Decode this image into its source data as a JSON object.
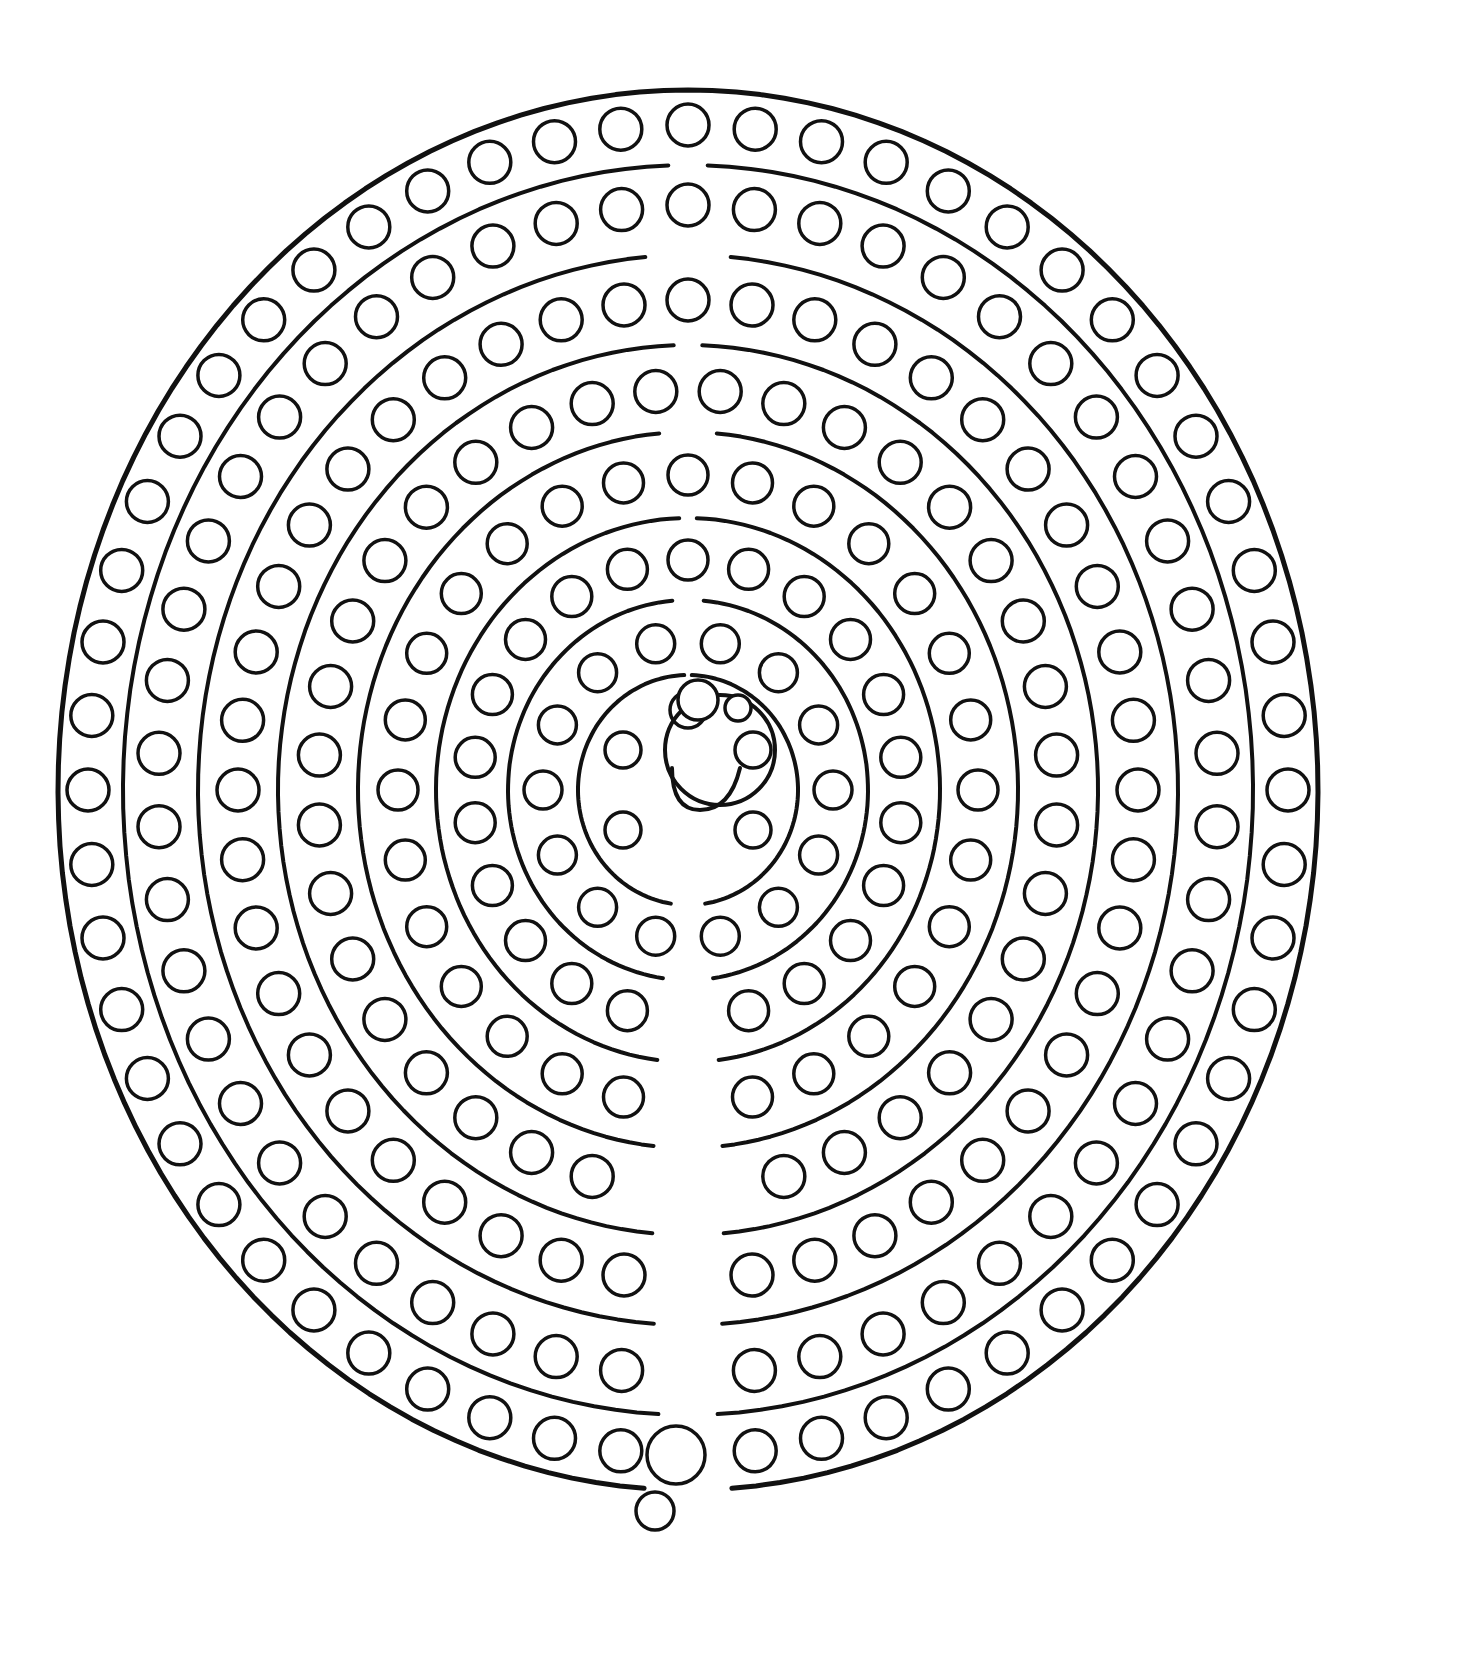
{
  "image": {
    "subject": "dot marker labyrinth coloring page",
    "background_color": "#ffffff",
    "line_color": "#111111",
    "width": 1479,
    "height": 1659
  },
  "labyrinth": {
    "center": [
      688,
      790
    ],
    "outer_boundary": {
      "rx": 630,
      "ry": 700,
      "stroke": 5
    },
    "rings": [
      {
        "name": "ring-1-outer",
        "rx": 600,
        "ry": 665,
        "dots": 56,
        "dot_r": 21
      },
      {
        "name": "ring-2",
        "rx": 530,
        "ry": 585,
        "dots": 50,
        "dot_r": 21
      },
      {
        "name": "ring-3",
        "rx": 450,
        "ry": 490,
        "dots": 44,
        "dot_r": 21
      },
      {
        "name": "ring-4",
        "rx": 370,
        "ry": 400,
        "dots": 36,
        "dot_r": 21
      },
      {
        "name": "ring-5",
        "rx": 290,
        "ry": 315,
        "dots": 28,
        "dot_r": 20
      },
      {
        "name": "ring-6",
        "rx": 215,
        "ry": 230,
        "dots": 22,
        "dot_r": 20
      },
      {
        "name": "ring-7",
        "rx": 145,
        "ry": 150,
        "dots": 14,
        "dot_r": 19
      },
      {
        "name": "ring-8-inner",
        "rx": 75,
        "ry": 80,
        "dots": 6,
        "dot_r": 18
      }
    ],
    "walls": [
      {
        "rx": 565,
        "ry": 625
      },
      {
        "rx": 490,
        "ry": 535
      },
      {
        "rx": 410,
        "ry": 445
      },
      {
        "rx": 330,
        "ry": 358
      },
      {
        "rx": 252,
        "ry": 272
      },
      {
        "rx": 180,
        "ry": 190
      },
      {
        "rx": 110,
        "ry": 115
      }
    ],
    "center_goal": {
      "cx": 720,
      "cy": 750,
      "r": 55
    },
    "center_hook": {
      "x1": 672,
      "y1": 768,
      "x2": 700,
      "y2": 810
    },
    "entry_dots": [
      {
        "cx": 676,
        "cy": 1455,
        "r": 29
      },
      {
        "cx": 655,
        "cy": 1511,
        "r": 19
      }
    ],
    "small_center_dots": [
      {
        "cx": 698,
        "cy": 700,
        "r": 20
      },
      {
        "cx": 738,
        "cy": 708,
        "r": 13
      }
    ]
  }
}
